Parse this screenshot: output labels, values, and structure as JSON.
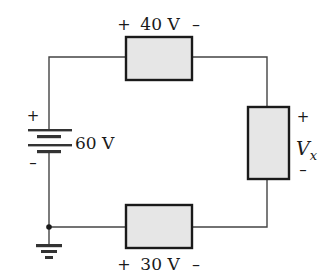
{
  "diagram": {
    "type": "series circuit",
    "colors": {
      "wire": "#444444",
      "resistor_fill": "#e6e6e6",
      "resistor_border": "#1a1a1a",
      "text": "#1a1a1a"
    },
    "source": {
      "label": "60 V",
      "plus": "+",
      "minus": "–"
    },
    "resistor_top": {
      "label": "40 V",
      "plus": "+",
      "minus": "–"
    },
    "resistor_right": {
      "label_main": "V",
      "label_sub": "x",
      "plus": "+",
      "minus": "–"
    },
    "resistor_bottom": {
      "label": "30 V",
      "plus": "+",
      "minus": "–"
    },
    "ground": {
      "symbol": "ground"
    }
  }
}
